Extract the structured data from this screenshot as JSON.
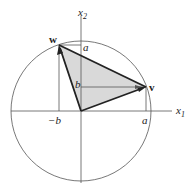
{
  "diagram": {
    "axes": {
      "x_label": "x",
      "x_sub": "1",
      "y_label": "x",
      "y_sub": "2"
    },
    "vectors": [
      {
        "name": "w",
        "label": "w"
      },
      {
        "name": "v",
        "label": "v"
      }
    ],
    "tick_labels": {
      "a_top": "a",
      "b_mid": "b",
      "neg_b": "−b",
      "a_right": "a"
    },
    "colors": {
      "fill": "#d9d9d9",
      "stroke": "#222222",
      "circle": "#555555"
    }
  }
}
